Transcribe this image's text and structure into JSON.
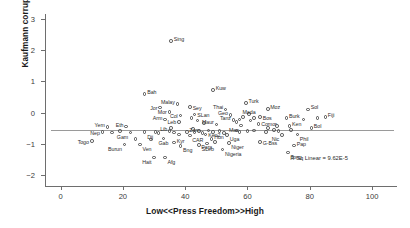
{
  "chart_data": {
    "type": "scatter",
    "title": "",
    "xlabel": "Low<<Press Freedom>>High",
    "ylabel": "Kaufmann corruption 2006",
    "xlim": [
      -5,
      108
    ],
    "ylim": [
      -2.35,
      3.15
    ],
    "xticks": [
      0,
      20,
      40,
      60,
      80,
      100
    ],
    "yticks": [
      3,
      2,
      1,
      0,
      -1,
      -2
    ],
    "grid": false,
    "legend": null,
    "annotations": [
      {
        "text": "R Sq Linear = 9.62E-5",
        "x": 83,
        "y": -1.47
      }
    ],
    "fit_line": {
      "type": "horizontal",
      "y": -0.55,
      "x_from": -3,
      "x_to": 107
    },
    "marker": "open-circle",
    "points": [
      {
        "label": "Sing",
        "x": 35.5,
        "y": 2.28,
        "lp": "ne"
      },
      {
        "label": "Bah",
        "x": 27.0,
        "y": 0.6,
        "lp": "ne"
      },
      {
        "label": "Kuw",
        "x": 49.0,
        "y": 0.72,
        "lp": "ne"
      },
      {
        "label": "Malay",
        "x": 37.5,
        "y": 0.27,
        "lp": "nw"
      },
      {
        "label": "Jor",
        "x": 32.0,
        "y": 0.16,
        "lp": "w"
      },
      {
        "label": "Sey",
        "x": 41.5,
        "y": 0.17,
        "lp": "e"
      },
      {
        "label": "Mor",
        "x": 35.0,
        "y": 0.02,
        "lp": "w"
      },
      {
        "label": "Thai",
        "x": 53.0,
        "y": 0.1,
        "lp": "nw"
      },
      {
        "label": "Turk",
        "x": 59.5,
        "y": 0.3,
        "lp": "ne"
      },
      {
        "label": "Moz",
        "x": 66.5,
        "y": 0.12,
        "lp": "ne"
      },
      {
        "label": "Sol",
        "x": 79.5,
        "y": 0.1,
        "lp": "ne"
      },
      {
        "label": "Col",
        "x": 38.5,
        "y": -0.1,
        "lp": "w"
      },
      {
        "label": "SLan",
        "x": 43.0,
        "y": -0.07,
        "lp": "e"
      },
      {
        "label": "Geo",
        "x": 54.5,
        "y": -0.08,
        "lp": "nw"
      },
      {
        "label": "Mada",
        "x": 60.5,
        "y": -0.05,
        "lp": "n"
      },
      {
        "label": "Bos",
        "x": 64.0,
        "y": -0.15,
        "lp": "e"
      },
      {
        "label": "Arm",
        "x": 33.5,
        "y": -0.23,
        "lp": "nw"
      },
      {
        "label": "Leb",
        "x": 38.0,
        "y": -0.3,
        "lp": "w"
      },
      {
        "label": "Tanz",
        "x": 55.5,
        "y": -0.24,
        "lp": "nw"
      },
      {
        "label": "Burk",
        "x": 72.5,
        "y": -0.17,
        "lp": "ne"
      },
      {
        "label": "Fiji",
        "x": 85.0,
        "y": -0.14,
        "lp": "ne"
      },
      {
        "label": "Yem",
        "x": 15.0,
        "y": -0.46,
        "lp": "nw"
      },
      {
        "label": "Eth",
        "x": 21.0,
        "y": -0.45,
        "lp": "nw"
      },
      {
        "label": "Maur",
        "x": 50.0,
        "y": -0.38,
        "lp": "nw"
      },
      {
        "label": "Mac",
        "x": 58.0,
        "y": -0.41,
        "lp": "sw"
      },
      {
        "label": "Comor",
        "x": 63.5,
        "y": -0.36,
        "lp": "e"
      },
      {
        "label": "Ken",
        "x": 73.5,
        "y": -0.44,
        "lp": "ne"
      },
      {
        "label": "Bol",
        "x": 80.5,
        "y": -0.5,
        "lp": "ne"
      },
      {
        "label": "Nep",
        "x": 13.5,
        "y": -0.63,
        "lp": "w"
      },
      {
        "label": "Gam",
        "x": 22.5,
        "y": -0.64,
        "lp": "sw"
      },
      {
        "label": "Dji",
        "x": 27.0,
        "y": -0.63,
        "lp": "se"
      },
      {
        "label": "Lib",
        "x": 35.0,
        "y": -0.6,
        "lp": "nw"
      },
      {
        "label": "Zam",
        "x": 40.5,
        "y": -0.62,
        "lp": "ne"
      },
      {
        "label": "CAR",
        "x": 41.5,
        "y": -0.73,
        "lp": "se"
      },
      {
        "label": "Ken2",
        "x": 46.5,
        "y": -0.7,
        "lp": "e"
      },
      {
        "label": "Uga",
        "x": 53.5,
        "y": -0.72,
        "lp": "se"
      },
      {
        "label": "Nic",
        "x": 71.0,
        "y": -0.72,
        "lp": "sw"
      },
      {
        "label": "Phil",
        "x": 76.0,
        "y": -0.7,
        "lp": "se"
      },
      {
        "label": "Togo",
        "x": 10.0,
        "y": -0.92,
        "lp": "w"
      },
      {
        "label": "Burun",
        "x": 20.5,
        "y": -1.02,
        "lp": "sw"
      },
      {
        "label": "Ven",
        "x": 25.5,
        "y": -1.02,
        "lp": "se"
      },
      {
        "label": "Gab",
        "x": 33.0,
        "y": -0.83,
        "lp": "s"
      },
      {
        "label": "Kyr",
        "x": 36.5,
        "y": -0.96,
        "lp": "ne"
      },
      {
        "label": "Bng",
        "x": 38.5,
        "y": -1.07,
        "lp": "se"
      },
      {
        "label": "SLeo",
        "x": 44.5,
        "y": -1.03,
        "lp": "se"
      },
      {
        "label": "Hon",
        "x": 48.5,
        "y": -0.84,
        "lp": "ne"
      },
      {
        "label": "Para",
        "x": 49.5,
        "y": -0.95,
        "lp": "sw"
      },
      {
        "label": "Niger",
        "x": 54.0,
        "y": -0.97,
        "lp": "se"
      },
      {
        "label": "G-Bss",
        "x": 64.0,
        "y": -0.95,
        "lp": "e"
      },
      {
        "label": "Nigeria",
        "x": 52.0,
        "y": -1.18,
        "lp": "se"
      },
      {
        "label": "Pap",
        "x": 75.0,
        "y": -1.06,
        "lp": "ne"
      },
      {
        "label": "Tong",
        "x": 73.0,
        "y": -1.28,
        "lp": "se"
      },
      {
        "label": "Hait",
        "x": 30.0,
        "y": -1.44,
        "lp": "sw"
      },
      {
        "label": "Afg",
        "x": 33.5,
        "y": -1.44,
        "lp": "se"
      },
      {
        "label": "p01",
        "x": 16.5,
        "y": -0.64,
        "lp": "none"
      },
      {
        "label": "p02",
        "x": 19.0,
        "y": -0.6,
        "lp": "none"
      },
      {
        "label": "p03",
        "x": 30.5,
        "y": -0.62,
        "lp": "none"
      },
      {
        "label": "p04",
        "x": 31.5,
        "y": -0.66,
        "lp": "none"
      },
      {
        "label": "p05",
        "x": 36.5,
        "y": -0.64,
        "lp": "none"
      },
      {
        "label": "p06",
        "x": 38.0,
        "y": -0.7,
        "lp": "none"
      },
      {
        "label": "p07",
        "x": 43.0,
        "y": -0.64,
        "lp": "none"
      },
      {
        "label": "p08",
        "x": 44.5,
        "y": -0.6,
        "lp": "none"
      },
      {
        "label": "p09",
        "x": 45.5,
        "y": -0.66,
        "lp": "none"
      },
      {
        "label": "p10",
        "x": 47.5,
        "y": -0.58,
        "lp": "none"
      },
      {
        "label": "p11",
        "x": 49.0,
        "y": -0.63,
        "lp": "none"
      },
      {
        "label": "p12",
        "x": 51.0,
        "y": -0.6,
        "lp": "none"
      },
      {
        "label": "p13",
        "x": 52.5,
        "y": -0.66,
        "lp": "none"
      },
      {
        "label": "p14",
        "x": 56.5,
        "y": -0.57,
        "lp": "none"
      },
      {
        "label": "p15",
        "x": 57.5,
        "y": -0.63,
        "lp": "none"
      },
      {
        "label": "p16",
        "x": 60.0,
        "y": -0.6,
        "lp": "none"
      },
      {
        "label": "p17",
        "x": 62.0,
        "y": -0.57,
        "lp": "none"
      },
      {
        "label": "p18",
        "x": 66.0,
        "y": -0.62,
        "lp": "none"
      },
      {
        "label": "p19",
        "x": 68.5,
        "y": -0.55,
        "lp": "none"
      },
      {
        "label": "p20",
        "x": 70.0,
        "y": -0.6,
        "lp": "none"
      },
      {
        "label": "p21",
        "x": 56.5,
        "y": -0.3,
        "lp": "none"
      },
      {
        "label": "p22",
        "x": 57.5,
        "y": -0.22,
        "lp": "none"
      },
      {
        "label": "p23",
        "x": 58.5,
        "y": -0.14,
        "lp": "none"
      },
      {
        "label": "p24",
        "x": 61.0,
        "y": -0.26,
        "lp": "none"
      },
      {
        "label": "p25",
        "x": 62.0,
        "y": -0.18,
        "lp": "none"
      },
      {
        "label": "p26",
        "x": 46.0,
        "y": -0.33,
        "lp": "none"
      },
      {
        "label": "p27",
        "x": 44.0,
        "y": -0.26,
        "lp": "none"
      },
      {
        "label": "p28",
        "x": 42.0,
        "y": -0.18,
        "lp": "none"
      },
      {
        "label": "p29",
        "x": 66.5,
        "y": -0.5,
        "lp": "none"
      },
      {
        "label": "p30",
        "x": 69.5,
        "y": -0.44,
        "lp": "none"
      },
      {
        "label": "p31",
        "x": 74.0,
        "y": -0.55,
        "lp": "none"
      },
      {
        "label": "p32",
        "x": 78.0,
        "y": -0.22,
        "lp": "none"
      },
      {
        "label": "p33",
        "x": 82.5,
        "y": -0.18,
        "lp": "none"
      },
      {
        "label": "p34",
        "x": 29.0,
        "y": -0.86,
        "lp": "none"
      },
      {
        "label": "p35",
        "x": 24.0,
        "y": -0.84,
        "lp": "none"
      },
      {
        "label": "p36",
        "x": 47.0,
        "y": -0.99,
        "lp": "none"
      },
      {
        "label": "p37",
        "x": 42.5,
        "y": -0.52,
        "lp": "none"
      },
      {
        "label": "p38",
        "x": 35.5,
        "y": -0.5,
        "lp": "none"
      }
    ]
  }
}
